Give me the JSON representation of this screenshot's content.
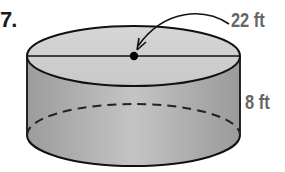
{
  "problem": {
    "number": "7."
  },
  "figure": {
    "shape": "cylinder",
    "labels": {
      "diameter": "22 ft",
      "height": "8 ft"
    },
    "center_point": "center-dot",
    "colors": {
      "outline": "#111111",
      "side_fill": "#a9a9a9",
      "top_fill": "#cfcfcf",
      "label": "#666666"
    }
  }
}
